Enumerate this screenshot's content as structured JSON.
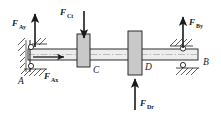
{
  "diagram": {
    "type": "free-body-diagram",
    "background_color": "#ffffff",
    "line_color": "#1a1a1a",
    "gear_fill_color": "#c9c9c9",
    "shaft_fill_color": "#ebebeb",
    "points": [
      {
        "id": "A",
        "label": "A",
        "x": 18,
        "y": 80,
        "role": "left-bearing-support"
      },
      {
        "id": "B",
        "label": "B",
        "x": 203,
        "y": 62,
        "role": "right-bearing-support"
      },
      {
        "id": "C",
        "label": "C",
        "x": 90,
        "y": 70,
        "role": "gear-c"
      },
      {
        "id": "D",
        "label": "D",
        "x": 142,
        "y": 67,
        "role": "gear-d"
      }
    ],
    "forces": [
      {
        "id": "F_Ay",
        "base": "F",
        "sub": "Ay",
        "label_x": 12,
        "label_y": 22,
        "direction": "up",
        "applied_at": "A",
        "arrow": {
          "x1": 35,
          "y1": 47,
          "x2": 35,
          "y2": 14
        }
      },
      {
        "id": "F_Ax",
        "base": "F",
        "sub": "Ax",
        "label_x": 46,
        "label_y": 78,
        "direction": "right",
        "applied_at": "A",
        "arrow": {
          "x1": 33,
          "y1": 57,
          "x2": 64,
          "y2": 57
        }
      },
      {
        "id": "F_Ct",
        "base": "F",
        "sub": "Ct",
        "label_x": 61,
        "label_y": 15,
        "direction": "down",
        "applied_at": "C",
        "arrow": {
          "x1": 84,
          "y1": 11,
          "x2": 84,
          "y2": 38
        }
      },
      {
        "id": "F_Dr",
        "base": "F",
        "sub": "Dr",
        "label_x": 142,
        "label_y": 104,
        "direction": "up",
        "applied_at": "D",
        "arrow": {
          "x1": 135,
          "y1": 110,
          "x2": 135,
          "y2": 79
        }
      },
      {
        "id": "F_By",
        "base": "F",
        "sub": "By",
        "label_x": 192,
        "label_y": 26,
        "direction": "up",
        "applied_at": "B",
        "arrow": {
          "x1": 183,
          "y1": 48,
          "x2": 183,
          "y2": 17
        }
      }
    ],
    "members": {
      "shaft": {
        "x": 28,
        "y": 49,
        "width": 170,
        "height": 11
      },
      "gear_c": {
        "x": 77,
        "y": 34,
        "width": 13,
        "height": 33
      },
      "gear_d": {
        "x": 128,
        "y": 31,
        "width": 14,
        "height": 44
      }
    }
  }
}
